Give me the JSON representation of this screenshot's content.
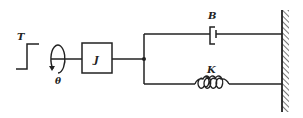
{
  "diagram": {
    "labels": {
      "torque": "T",
      "angle": "θ",
      "inertia": "J",
      "damper": "B",
      "spring": "K"
    },
    "colors": {
      "line": "#222222",
      "background": "#ffffff"
    }
  }
}
